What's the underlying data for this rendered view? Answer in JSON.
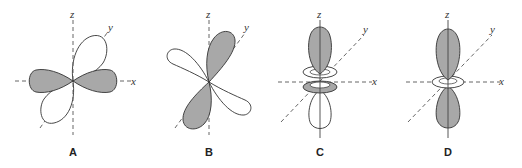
{
  "figure": {
    "panels": [
      {
        "id": "A",
        "label": "A",
        "axes": {
          "z": "z",
          "y": "y",
          "x": "x"
        },
        "shaded_lobes": "along x-axis",
        "white_lobes": "along y-axis"
      },
      {
        "id": "B",
        "label": "B",
        "axes": {
          "z": "z",
          "y": "y",
          "x": "x"
        },
        "shaded_lobes": "along y-axis",
        "white_lobes": "along x-axis"
      },
      {
        "id": "C",
        "label": "C",
        "axes": {
          "z": "z",
          "y": "y",
          "x": "x"
        },
        "shaded_lobes": "upper z lobe and lower torus",
        "white_lobes": "upper torus and lower z lobe"
      },
      {
        "id": "D",
        "label": "D",
        "axes": {
          "z": "z",
          "y": "y",
          "x": "x"
        },
        "shaded_lobes": "both z lobes",
        "white_lobes": "torus in xy-plane"
      }
    ]
  },
  "colors": {
    "shaded": "#a8a8a8",
    "outline": "#333333",
    "background": "#ffffff"
  }
}
